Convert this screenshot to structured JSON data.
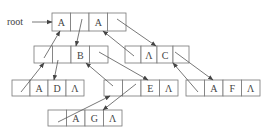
{
  "diagram": {
    "title": "",
    "type": "generalized-list-storage-structure",
    "root_label": "root",
    "null_symbol": "Λ",
    "nodes": [
      {
        "id": "n_root",
        "x": 52,
        "y": 13,
        "w": 74,
        "h": 18,
        "cells": [
          "A",
          "",
          "A",
          ""
        ],
        "labels": [
          "A",
          "pointer",
          "A",
          "pointer"
        ]
      },
      {
        "id": "n_B",
        "x": 34,
        "y": 46,
        "w": 74,
        "h": 17,
        "cells": [
          "",
          "",
          "B",
          ""
        ],
        "labels": [
          "pointer",
          "pointer",
          "B",
          "pointer"
        ]
      },
      {
        "id": "n_C",
        "x": 125,
        "y": 46,
        "w": 64,
        "h": 17,
        "cells": [
          "",
          "Λ",
          "C",
          ""
        ],
        "labels": [
          "pointer",
          "null",
          "C",
          "pointer"
        ]
      },
      {
        "id": "n_ADA",
        "x": 12,
        "y": 80,
        "w": 72,
        "h": 16,
        "cells": [
          "",
          "A",
          "D",
          "Λ"
        ],
        "labels": [
          "pointer",
          "A",
          "D",
          "null"
        ]
      },
      {
        "id": "n_E",
        "x": 104,
        "y": 80,
        "w": 74,
        "h": 16,
        "cells": [
          "",
          "",
          "E",
          "Λ"
        ],
        "labels": [
          "pointer",
          "pointer",
          "E",
          "null"
        ]
      },
      {
        "id": "n_AFA",
        "x": 186,
        "y": 80,
        "w": 74,
        "h": 16,
        "cells": [
          "",
          "A",
          "F",
          "Λ"
        ],
        "labels": [
          "pointer",
          "A",
          "F",
          "null"
        ]
      },
      {
        "id": "n_AGA",
        "x": 48,
        "y": 110,
        "w": 74,
        "h": 16,
        "cells": [
          "",
          "A",
          "G",
          "Λ"
        ],
        "labels": [
          "pointer",
          "A",
          "G",
          "null"
        ]
      }
    ],
    "edges": [
      {
        "from": "root-label",
        "to": "n_root",
        "x1": 32,
        "y1": 22,
        "x2": 52,
        "y2": 22
      },
      {
        "from": "n_B.cell0",
        "to": "n_root.cell0",
        "x1": 44,
        "y1": 58,
        "x2": 60,
        "y2": 31
      },
      {
        "from": "n_root.cell1",
        "to": "n_B.cell2",
        "x1": 82,
        "y1": 19,
        "x2": 76,
        "y2": 46
      },
      {
        "from": "n_root.cell3",
        "to": "n_C.cell1",
        "x1": 117,
        "y1": 19,
        "x2": 156,
        "y2": 46
      },
      {
        "from": "n_C.cell0",
        "to": "n_root.cell2",
        "x1": 134,
        "y1": 56,
        "x2": 103,
        "y2": 31
      },
      {
        "from": "n_B.cell3",
        "to": "n_E.cell2",
        "x1": 99,
        "y1": 52,
        "x2": 148,
        "y2": 80
      },
      {
        "from": "n_C.cell3",
        "to": "n_AFA.cell1",
        "x1": 175,
        "y1": 52,
        "x2": 213,
        "y2": 80
      },
      {
        "from": "n_AFA.cell0",
        "to": "n_C.cell2",
        "x1": 198,
        "y1": 92,
        "x2": 173,
        "y2": 63
      },
      {
        "from": "n_ADA.cell0",
        "to": "n_B.cell0",
        "x1": 21,
        "y1": 92,
        "x2": 44,
        "y2": 63
      },
      {
        "from": "n_B.cell1",
        "to": "n_ADA.cell2",
        "x1": 58,
        "y1": 60,
        "x2": 54,
        "y2": 80
      },
      {
        "from": "n_E.cell0",
        "to": "n_B.cell2",
        "x1": 113,
        "y1": 86,
        "x2": 86,
        "y2": 63
      },
      {
        "from": "n_AGA.cell0",
        "to": "n_E.cell0",
        "x1": 58,
        "y1": 122,
        "x2": 110,
        "y2": 96
      },
      {
        "from": "n_E.cell1",
        "to": "n_AGA.cell2",
        "x1": 136,
        "y1": 84,
        "x2": 103,
        "y2": 110
      }
    ]
  }
}
